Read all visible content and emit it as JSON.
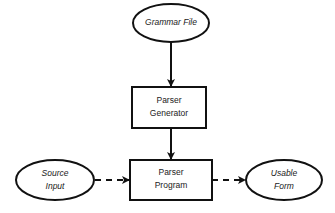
{
  "nodes": {
    "grammar_file": {
      "label": "Grammar File",
      "shape": "ellipse"
    },
    "parser_generator": {
      "line1": "Parser",
      "line2": "Generator",
      "shape": "rectangle"
    },
    "parser_program": {
      "line1": "Parser",
      "line2": "Program",
      "shape": "rectangle"
    },
    "source_input": {
      "line1": "Source",
      "line2": "Input",
      "shape": "ellipse"
    },
    "usable_form": {
      "line1": "Usable",
      "line2": "Form",
      "shape": "ellipse"
    }
  },
  "edges": [
    {
      "from": "Grammar File",
      "to": "Parser Generator",
      "style": "solid"
    },
    {
      "from": "Parser Generator",
      "to": "Parser Program",
      "style": "solid"
    },
    {
      "from": "Source Input",
      "to": "Parser Program",
      "style": "dashed"
    },
    {
      "from": "Parser Program",
      "to": "Usable Form",
      "style": "dashed"
    }
  ]
}
